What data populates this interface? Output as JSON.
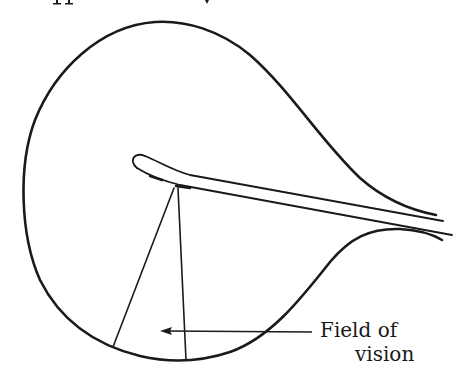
{
  "figure": {
    "labels": {
      "line1": "Field of",
      "line2": "vision"
    },
    "colors": {
      "ink": "#1a1a1a",
      "background": "#ffffff"
    },
    "top_fragment_note": "cropped text descenders at top edge"
  }
}
